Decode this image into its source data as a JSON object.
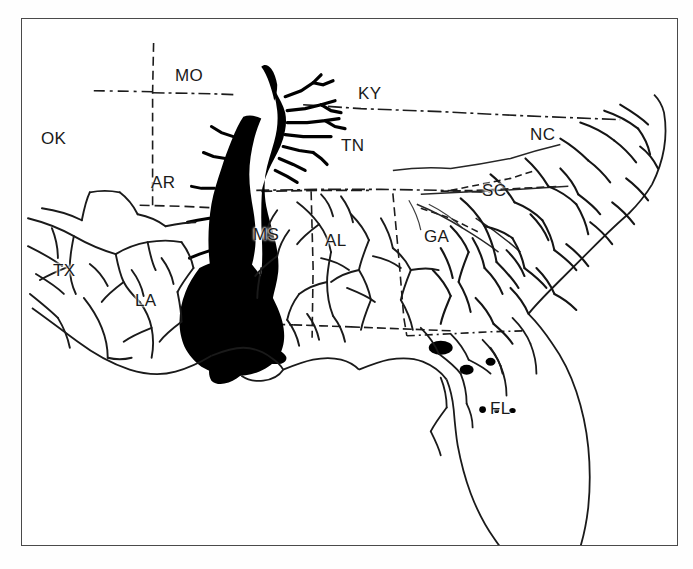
{
  "figure": {
    "kind": "thematic-map",
    "title_visible": false,
    "background_color": "#ffffff",
    "frame_color": "#4a4a4a",
    "ink_color": "#000000",
    "region_fill_color": "#000000"
  },
  "map": {
    "frame": {
      "x": 21,
      "y": 18,
      "width": 657,
      "height": 528
    },
    "state_labels": [
      {
        "code": "OK",
        "name": "Oklahoma",
        "x": 40,
        "y": 129
      },
      {
        "code": "MO",
        "name": "Missouri",
        "x": 174,
        "y": 66
      },
      {
        "code": "KY",
        "name": "Kentucky",
        "x": 357,
        "y": 84
      },
      {
        "code": "AR",
        "name": "Arkansas",
        "x": 150,
        "y": 173
      },
      {
        "code": "TN",
        "name": "Tennessee",
        "x": 340,
        "y": 136
      },
      {
        "code": "NC",
        "name": "North Carolina",
        "x": 529,
        "y": 125
      },
      {
        "code": "SC",
        "name": "South Carolina",
        "x": 481,
        "y": 181
      },
      {
        "code": "MS",
        "name": "Mississippi",
        "x": 252,
        "y": 225
      },
      {
        "code": "AL",
        "name": "Alabama",
        "x": 324,
        "y": 231
      },
      {
        "code": "GA",
        "name": "Georgia",
        "x": 423,
        "y": 227
      },
      {
        "code": "TX",
        "name": "Texas",
        "x": 52,
        "y": 261
      },
      {
        "code": "LA",
        "name": "Louisiana",
        "x": 134,
        "y": 291
      },
      {
        "code": "FL",
        "name": "Florida",
        "x": 489,
        "y": 399
      }
    ],
    "legend": [],
    "shaded_region": {
      "name": "Mississippi Alluvial Valley",
      "fill": "#000000",
      "states_covered": [
        "MO",
        "AR",
        "MS",
        "LA",
        "TN"
      ]
    }
  }
}
